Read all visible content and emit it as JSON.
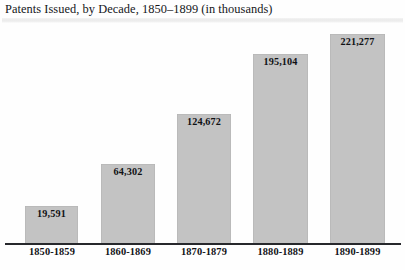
{
  "chart_data": {
    "type": "bar",
    "title": "Patents Issued, by Decade, 1850–1899 (in thousands)",
    "xlabel": "",
    "ylabel": "",
    "grid": false,
    "legend": "none",
    "ylim": [
      0,
      240000
    ],
    "categories": [
      "1850-1859",
      "1860-1869",
      "1870-1879",
      "1880-1889",
      "1890-1899"
    ],
    "values": [
      19591,
      64302,
      124672,
      195104,
      221277
    ],
    "value_labels": [
      "19,591",
      "64,302",
      "124,672",
      "195,104",
      "221,277"
    ],
    "bar_color": "#c3c3c3",
    "axis_color": "#27282c",
    "text_color": "#111216",
    "background_color": "#fefefe"
  },
  "bars": [
    {
      "label": "1850-1859",
      "value_label": "19,591",
      "left": 25,
      "width": 53,
      "height": 39
    },
    {
      "label": "1860-1869",
      "value_label": "64,302",
      "left": 101,
      "width": 54,
      "height": 81
    },
    {
      "label": "1870-1879",
      "value_label": "124,672",
      "left": 177,
      "width": 54,
      "height": 131
    },
    {
      "label": "1880-1889",
      "value_label": "195,104",
      "left": 253,
      "width": 55,
      "height": 191
    },
    {
      "label": "1890-1899",
      "value_label": "221,277",
      "left": 330,
      "width": 55,
      "height": 211
    }
  ],
  "axis_label_positions": [
    {
      "left": 25,
      "width": 54
    },
    {
      "left": 101,
      "width": 54
    },
    {
      "left": 177,
      "width": 54
    },
    {
      "left": 253,
      "width": 55
    },
    {
      "left": 330,
      "width": 55
    }
  ]
}
